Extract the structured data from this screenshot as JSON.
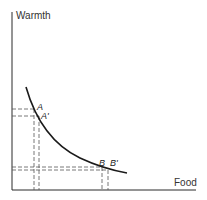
{
  "diagram": {
    "type": "indifference-curve",
    "axes": {
      "y_label": "Warmth",
      "x_label": "Food"
    },
    "curve": {
      "description": "convex downward-sloping curve",
      "start": [
        26,
        87
      ],
      "end": [
        127,
        173
      ]
    },
    "points": [
      {
        "id": "A",
        "label": "A",
        "x": 34,
        "y": 109
      },
      {
        "id": "A-prime",
        "label": "A'",
        "x": 39,
        "y": 116
      },
      {
        "id": "B",
        "label": "B",
        "x": 102,
        "y": 168
      },
      {
        "id": "B-prime",
        "label": "B'",
        "x": 108,
        "y": 170
      }
    ]
  }
}
